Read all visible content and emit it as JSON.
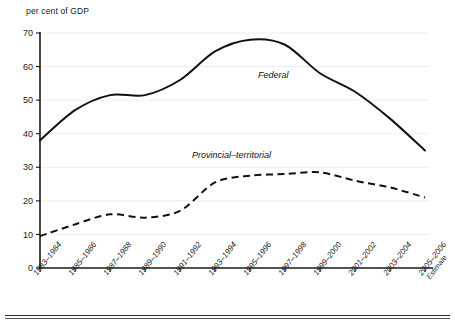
{
  "chart_data": {
    "type": "line",
    "title": "",
    "ylabel": "per cent of GDP",
    "xlabel": "",
    "ylim": [
      0,
      70
    ],
    "yticks": [
      0,
      10,
      20,
      30,
      40,
      50,
      60,
      70
    ],
    "grid": true,
    "legend_position": "inline-annotation",
    "categories": [
      "1983–1984",
      "1985–1986",
      "1987–1988",
      "1989–1990",
      "1991–1992",
      "1993–1994",
      "1995–1996",
      "1997–1998",
      "1999–2000",
      "2001–2002",
      "2003–2004",
      "2005–2006"
    ],
    "last_category_note": "Estimate",
    "series": [
      {
        "name": "Federal",
        "style": "solid",
        "values": [
          38.0,
          47.0,
          51.5,
          51.5,
          56.0,
          64.5,
          68.0,
          66.5,
          58.0,
          52.5,
          44.5,
          35.0
        ]
      },
      {
        "name": "Provincial–territorial",
        "style": "dashed",
        "values": [
          9.5,
          13.0,
          16.0,
          15.0,
          17.0,
          25.5,
          27.5,
          28.0,
          28.5,
          26.0,
          24.0,
          21.0
        ]
      }
    ],
    "annotations": [
      {
        "text": "Federal",
        "series": "Federal"
      },
      {
        "text": "Provincial–territorial",
        "series": "Provincial–territorial"
      }
    ]
  }
}
